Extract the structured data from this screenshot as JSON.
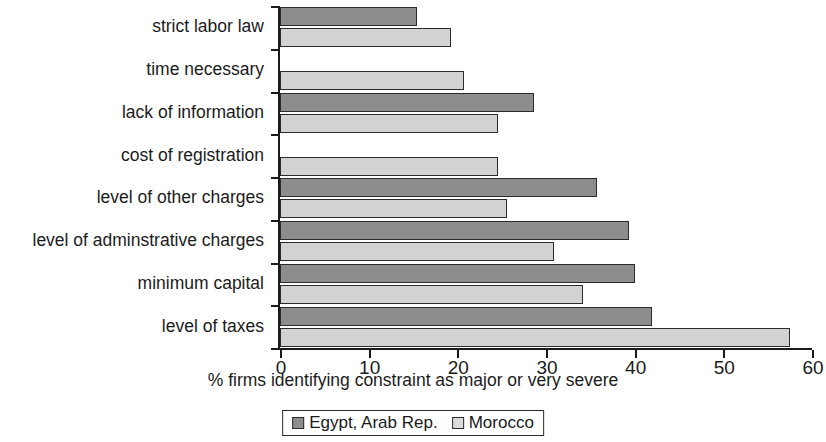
{
  "chart_data": {
    "type": "bar",
    "orientation": "horizontal",
    "title": "",
    "xlabel": "% firms identifying constraint as major or very severe",
    "ylabel": "",
    "xlim": [
      0,
      60
    ],
    "xticks": [
      0,
      10,
      20,
      30,
      40,
      50,
      60
    ],
    "xtick_labels": [
      "0",
      "10",
      "20",
      "30",
      "40",
      "50",
      "60"
    ],
    "grid": false,
    "legend_position": "bottom-center",
    "categories": [
      "strict labor law",
      "time necessary",
      "lack of information",
      "cost of registration",
      "level of other charges",
      "level of adminstrative charges",
      "minimum capital",
      "level of taxes"
    ],
    "series": [
      {
        "name": "Egypt, Arab Rep.",
        "color": "#8d8d8d",
        "values": [
          15.5,
          null,
          28.6,
          null,
          35.8,
          39.4,
          40.0,
          42.0
        ]
      },
      {
        "name": "Morocco",
        "color": "#d2d2d2",
        "values": [
          19.3,
          20.7,
          24.6,
          24.6,
          25.6,
          30.9,
          34.2,
          57.5
        ]
      }
    ]
  },
  "legend": {
    "entries": [
      {
        "label": "Egypt, Arab Rep.",
        "swatch": "egypt"
      },
      {
        "label": "Morocco",
        "swatch": "morocco"
      }
    ]
  }
}
